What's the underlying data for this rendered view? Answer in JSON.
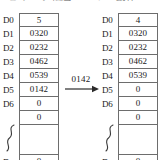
{
  "caption": {
    "clipped_text": "① データ転送 — シフト動作"
  },
  "transfer": {
    "value": "0142",
    "arrow_icon": "arrow-right-icon"
  },
  "tables": [
    {
      "id": "before",
      "rows": [
        {
          "label": "D0",
          "value": "5"
        },
        {
          "label": "D1",
          "value": "0320"
        },
        {
          "label": "D2",
          "value": "0232"
        },
        {
          "label": "D3",
          "value": "0462"
        },
        {
          "label": "D4",
          "value": "0539"
        },
        {
          "label": "D5",
          "value": "0142"
        },
        {
          "label": "D6",
          "value": "0"
        },
        {
          "label": "",
          "value": "0"
        },
        {
          "label": "",
          "value": ""
        },
        {
          "label": "Dn",
          "value": "0"
        }
      ]
    },
    {
      "id": "after",
      "rows": [
        {
          "label": "D0",
          "value": "4"
        },
        {
          "label": "D1",
          "value": "0320"
        },
        {
          "label": "D2",
          "value": "0232"
        },
        {
          "label": "D3",
          "value": "0462"
        },
        {
          "label": "D4",
          "value": "0539"
        },
        {
          "label": "D5",
          "value": "0"
        },
        {
          "label": "D6",
          "value": "0"
        },
        {
          "label": "",
          "value": "0"
        },
        {
          "label": "",
          "value": ""
        },
        {
          "label": "Dn",
          "value": "0"
        }
      ]
    }
  ]
}
